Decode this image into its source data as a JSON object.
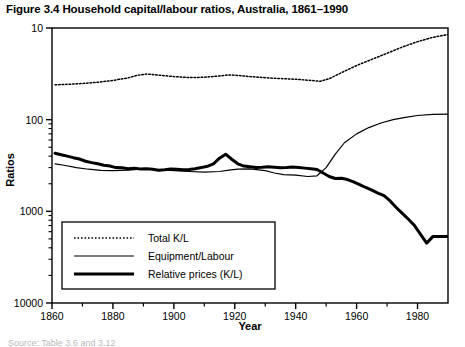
{
  "figure": {
    "title": "Figure 3.4 Household capital/labour ratios, Australia, 1861–1990",
    "source_caption": "Source: Table 3.6 and 3.12"
  },
  "axes": {
    "ylabel": "Ratios",
    "xlabel": "Year",
    "ytick_labels": [
      "10000",
      "1000",
      "100",
      "10"
    ],
    "xtick_labels": [
      "1860",
      "1880",
      "1900",
      "1920",
      "1940",
      "1960",
      "1980"
    ]
  },
  "legend": {
    "items": [
      {
        "label": "Total K/L",
        "style": "dotted"
      },
      {
        "label": "Equipment/Labour",
        "style": "thin-solid"
      },
      {
        "label": "Relative prices (K/L)",
        "style": "thick-solid"
      }
    ]
  },
  "colors": {
    "line": "#000000",
    "background": "#ffffff",
    "axis": "#000000"
  },
  "chart_data": {
    "type": "line",
    "title": "Figure 3.4 Household capital/labour ratios, Australia, 1861–1990",
    "xlabel": "Year",
    "ylabel": "Ratios",
    "yscale": "log",
    "ylim": [
      10,
      10000
    ],
    "xlim": [
      1860,
      1990
    ],
    "grid": false,
    "legend_position": "lower-left-inside",
    "yticks": [
      10,
      100,
      1000,
      10000
    ],
    "xticks": [
      1860,
      1880,
      1900,
      1920,
      1940,
      1960,
      1980
    ],
    "xminor_step": 10,
    "series": [
      {
        "name": "Total K/L",
        "style": "dotted",
        "x": [
          1861,
          1865,
          1870,
          1875,
          1880,
          1885,
          1888,
          1891,
          1895,
          1900,
          1905,
          1910,
          1915,
          1918,
          1921,
          1925,
          1930,
          1933,
          1936,
          1940,
          1945,
          1948,
          1951,
          1955,
          1960,
          1965,
          1970,
          1975,
          1980,
          1985,
          1990
        ],
        "y": [
          2400,
          2430,
          2480,
          2560,
          2680,
          2860,
          3050,
          3150,
          3060,
          2950,
          2880,
          2900,
          3000,
          3080,
          3040,
          2950,
          2870,
          2830,
          2800,
          2760,
          2680,
          2620,
          2800,
          3250,
          3900,
          4550,
          5300,
          6200,
          7100,
          7900,
          8500
        ]
      },
      {
        "name": "Equipment/Labour",
        "style": "thin-solid",
        "x": [
          1861,
          1864,
          1868,
          1872,
          1876,
          1880,
          1885,
          1890,
          1895,
          1900,
          1905,
          1910,
          1915,
          1918,
          1921,
          1925,
          1930,
          1933,
          1936,
          1940,
          1944,
          1947,
          1950,
          1953,
          1956,
          1960,
          1964,
          1968,
          1972,
          1976,
          1980,
          1985,
          1990
        ],
        "y": [
          330,
          318,
          300,
          288,
          280,
          278,
          282,
          290,
          286,
          278,
          272,
          268,
          272,
          282,
          288,
          290,
          278,
          262,
          252,
          248,
          240,
          244,
          300,
          420,
          560,
          700,
          820,
          920,
          1000,
          1060,
          1110,
          1140,
          1150
        ]
      },
      {
        "name": "Relative prices (K/L)",
        "style": "thick-solid",
        "x": [
          1861,
          1863,
          1865,
          1867,
          1869,
          1871,
          1873,
          1875,
          1877,
          1879,
          1881,
          1883,
          1885,
          1887,
          1889,
          1891,
          1893,
          1895,
          1897,
          1899,
          1901,
          1903,
          1905,
          1907,
          1909,
          1911,
          1913,
          1915,
          1917,
          1919,
          1921,
          1923,
          1925,
          1927,
          1929,
          1931,
          1933,
          1935,
          1937,
          1939,
          1941,
          1943,
          1945,
          1947,
          1949,
          1951,
          1953,
          1955,
          1957,
          1959,
          1961,
          1963,
          1965,
          1967,
          1969,
          1971,
          1973,
          1975,
          1977,
          1979,
          1981,
          1983,
          1985,
          1987,
          1990
        ],
        "y": [
          430,
          415,
          400,
          385,
          372,
          352,
          340,
          330,
          318,
          312,
          300,
          298,
          292,
          296,
          290,
          292,
          288,
          280,
          284,
          290,
          288,
          284,
          286,
          292,
          300,
          310,
          330,
          380,
          420,
          370,
          330,
          312,
          306,
          300,
          302,
          306,
          302,
          298,
          300,
          304,
          300,
          296,
          292,
          286,
          262,
          240,
          228,
          230,
          222,
          210,
          196,
          182,
          170,
          158,
          148,
          130,
          110,
          95,
          82,
          70,
          56,
          45,
          53,
          53,
          53
        ]
      }
    ]
  }
}
